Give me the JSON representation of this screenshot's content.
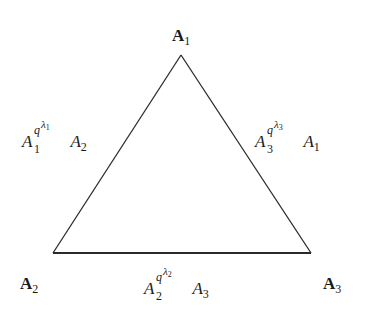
{
  "diagram": {
    "type": "triangle",
    "stroke_color": "#2a2a2a",
    "background": "#ffffff",
    "vertices": [
      {
        "id": "A1",
        "label": "A",
        "subscript": "1",
        "position": "top",
        "x": 181,
        "y": 55
      },
      {
        "id": "A2",
        "label": "A",
        "subscript": "2",
        "position": "bottom-left",
        "x": 53,
        "y": 253
      },
      {
        "id": "A3",
        "label": "A",
        "subscript": "3",
        "position": "bottom-right",
        "x": 311,
        "y": 253
      }
    ],
    "edges": [
      {
        "id": "edge-A1-A2",
        "from": "A1",
        "to": "A2",
        "side": "left",
        "base": "A",
        "base_subscript": "1",
        "exponent_base": "q",
        "exponent_symbol": "λ",
        "exponent_subscript": "1",
        "tail": "A",
        "tail_subscript": "2",
        "text": "A_1^{q^{λ_1}} A_2"
      },
      {
        "id": "edge-A2-A3",
        "from": "A2",
        "to": "A3",
        "side": "bottom",
        "base": "A",
        "base_subscript": "2",
        "exponent_base": "q",
        "exponent_symbol": "λ",
        "exponent_subscript": "2",
        "tail": "A",
        "tail_subscript": "3",
        "text": "A_2^{q^{λ_2}} A_3"
      },
      {
        "id": "edge-A3-A1",
        "from": "A3",
        "to": "A1",
        "side": "right",
        "base": "A",
        "base_subscript": "3",
        "exponent_base": "q",
        "exponent_symbol": "λ",
        "exponent_subscript": "3",
        "tail": "A",
        "tail_subscript": "1",
        "text": "A_3^{q^{λ_3}} A_1"
      }
    ]
  }
}
